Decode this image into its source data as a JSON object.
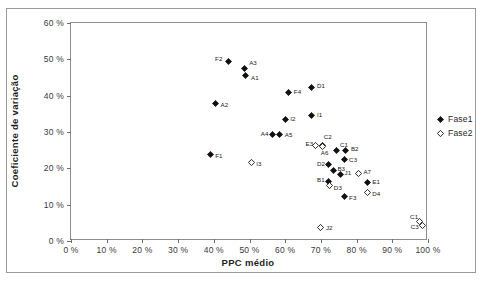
{
  "chart_data": {
    "type": "scatter",
    "title": "",
    "xlabel": "PPC médio",
    "ylabel": "Coeficiente de variação",
    "xlim": [
      0,
      100
    ],
    "ylim": [
      0,
      60
    ],
    "grid": false,
    "x_tick_labels": [
      "0 %",
      "10 %",
      "20 %",
      "30 %",
      "40 %",
      "50 %",
      "60 %",
      "70 %",
      "80 %",
      "90 %",
      "100 %"
    ],
    "x_tick_values": [
      0,
      10,
      20,
      30,
      40,
      50,
      60,
      70,
      80,
      90,
      100
    ],
    "y_tick_labels": [
      "0 %",
      "10 %",
      "20 %",
      "30 %",
      "40 %",
      "50 %",
      "60 %"
    ],
    "y_tick_values": [
      0,
      10,
      20,
      30,
      40,
      50,
      60
    ],
    "legend_position": "right",
    "legend": [
      "Fase1",
      "Fase2"
    ],
    "series": [
      {
        "name": "Fase1",
        "marker": "filled-diamond",
        "color": "#111111",
        "points": [
          {
            "label": "F2",
            "x": 44.0,
            "y": 49.5,
            "lx": -13,
            "ly": -2
          },
          {
            "label": "A3",
            "x": 48.5,
            "y": 47.5,
            "lx": 5,
            "ly": -5
          },
          {
            "label": "A1",
            "x": 49.0,
            "y": 45.5,
            "lx": 5,
            "ly": 2
          },
          {
            "label": "A2",
            "x": 40.5,
            "y": 37.8,
            "lx": 5,
            "ly": 1
          },
          {
            "label": "F4",
            "x": 61.0,
            "y": 40.8,
            "lx": 5,
            "ly": -1
          },
          {
            "label": "D1",
            "x": 67.5,
            "y": 42.3,
            "lx": 5,
            "ly": -1
          },
          {
            "label": "I2",
            "x": 60.0,
            "y": 33.5,
            "lx": 5,
            "ly": 0
          },
          {
            "label": "I1",
            "x": 67.5,
            "y": 34.5,
            "lx": 5,
            "ly": -1
          },
          {
            "label": "A4",
            "x": 56.5,
            "y": 29.3,
            "lx": -12,
            "ly": -1
          },
          {
            "label": "A5",
            "x": 58.5,
            "y": 29.3,
            "lx": 5,
            "ly": 0
          },
          {
            "label": "F1",
            "x": 39.0,
            "y": 23.8,
            "lx": 5,
            "ly": 1
          },
          {
            "label": "C2",
            "x": 70.5,
            "y": 26.3,
            "lx": 1,
            "ly": -8
          },
          {
            "label": "C1",
            "x": 74.5,
            "y": 24.8,
            "lx": 3,
            "ly": -6
          },
          {
            "label": "B2",
            "x": 77.0,
            "y": 25.0,
            "lx": 5,
            "ly": -1
          },
          {
            "label": "C3",
            "x": 76.5,
            "y": 22.3,
            "lx": 5,
            "ly": 0
          },
          {
            "label": "D2",
            "x": 72.0,
            "y": 21.0,
            "lx": -11,
            "ly": -1
          },
          {
            "label": "B3",
            "x": 73.5,
            "y": 19.3,
            "lx": 4,
            "ly": -2
          },
          {
            "label": "J1",
            "x": 75.5,
            "y": 18.2,
            "lx": 4,
            "ly": -2
          },
          {
            "label": "B1",
            "x": 72.0,
            "y": 16.3,
            "lx": -11,
            "ly": -2
          },
          {
            "label": "E1",
            "x": 83.0,
            "y": 16.0,
            "lx": 5,
            "ly": -1
          },
          {
            "label": "F3",
            "x": 76.5,
            "y": 12.3,
            "lx": 5,
            "ly": 2
          }
        ]
      },
      {
        "name": "Fase2",
        "marker": "open-diamond",
        "color": "#111111",
        "points": [
          {
            "label": "I3",
            "x": 50.5,
            "y": 21.5,
            "lx": 5,
            "ly": 1
          },
          {
            "label": "E3",
            "x": 68.5,
            "y": 26.3,
            "lx": -10,
            "ly": -1
          },
          {
            "label": "A6",
            "x": 70.5,
            "y": 26.0,
            "lx": -2,
            "ly": 6
          },
          {
            "label": "A7",
            "x": 80.5,
            "y": 18.5,
            "lx": 5,
            "ly": -2
          },
          {
            "label": "D3",
            "x": 72.5,
            "y": 15.3,
            "lx": 4,
            "ly": 3
          },
          {
            "label": "D4",
            "x": 83.0,
            "y": 13.3,
            "lx": 5,
            "ly": 1
          },
          {
            "label": "J2",
            "x": 70.0,
            "y": 3.8,
            "lx": 5,
            "ly": 1
          },
          {
            "label": "C1",
            "x": 97.5,
            "y": 5.5,
            "lx": -9,
            "ly": -4
          },
          {
            "label": "C3",
            "x": 98.5,
            "y": 4.3,
            "lx": -12,
            "ly": 2
          }
        ]
      }
    ]
  }
}
